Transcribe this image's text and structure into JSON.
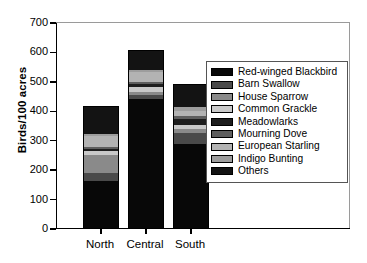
{
  "chart_data": {
    "type": "bar",
    "stacked": true,
    "title": "",
    "xlabel": "",
    "ylabel": "Birds/100 acres",
    "categories": [
      "North",
      "Central",
      "South"
    ],
    "ylim": [
      0,
      700
    ],
    "yticks": [
      0,
      100,
      200,
      300,
      400,
      500,
      600,
      700
    ],
    "ytick_labels": [
      "0",
      "100",
      "200",
      "300",
      "400",
      "500",
      "600",
      "700"
    ],
    "grid": false,
    "legend_position": "right",
    "series": [
      {
        "name": "Red-winged Blackbird",
        "color": "#080808",
        "values": [
          160,
          438,
          286
        ]
      },
      {
        "name": "Barn Swallow",
        "color": "#4a4a4a",
        "values": [
          28,
          14,
          38
        ]
      },
      {
        "name": "House Sparrow",
        "color": "#8a8a8a",
        "values": [
          60,
          10,
          14
        ]
      },
      {
        "name": "Common Grackle",
        "color": "#c9c9c9",
        "values": [
          14,
          18,
          12
        ]
      },
      {
        "name": "Meadowlarks",
        "color": "#1e1e1e",
        "values": [
          8,
          9,
          22
        ]
      },
      {
        "name": "Mourning Dove",
        "color": "#5e5e5e",
        "values": [
          6,
          8,
          10
        ]
      },
      {
        "name": "European Starling",
        "color": "#b3b3b3",
        "values": [
          35,
          34,
          16
        ]
      },
      {
        "name": "Indigo Bunting",
        "color": "#9d9d9d",
        "values": [
          7,
          5,
          14
        ]
      },
      {
        "name": "Others",
        "color": "#131313",
        "values": [
          92,
          67,
          75
        ]
      }
    ],
    "totals": [
      410,
      603,
      487
    ]
  }
}
